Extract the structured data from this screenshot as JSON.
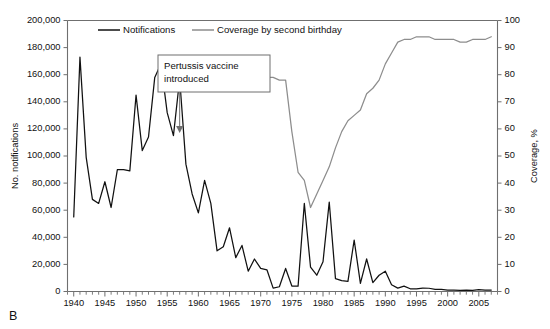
{
  "panel_label": "B",
  "legend": {
    "position": "top-inside",
    "entries": [
      {
        "label": "Notifications",
        "color": "#111111"
      },
      {
        "label": "Coverage by second birthday",
        "color": "#8d8d8d"
      }
    ]
  },
  "annotation": {
    "line1": "Pertussis vaccine",
    "line2": "introduced",
    "points_to_year": 1957
  },
  "chart_data": {
    "type": "line",
    "title": "",
    "subtitle": "",
    "xlabel": "",
    "ylabel": "No. notifications",
    "y2label": "Coverage, %",
    "xlim": [
      1939,
      2008
    ],
    "ylim": [
      0,
      200000
    ],
    "y2lim": [
      0,
      100
    ],
    "grid": false,
    "legend_position": "top-inside",
    "yticks": [
      0,
      20000,
      40000,
      60000,
      80000,
      100000,
      120000,
      140000,
      160000,
      180000,
      200000
    ],
    "ytick_labels": [
      "0",
      "20,000",
      "40,000",
      "60,000",
      "80,000",
      "100,000",
      "120,000",
      "140,000",
      "160,000",
      "180,000",
      "200,000"
    ],
    "y2ticks": [
      0,
      10,
      20,
      30,
      40,
      50,
      60,
      70,
      80,
      90,
      100
    ],
    "y2tick_labels": [
      "0",
      "10",
      "20",
      "30",
      "40",
      "50",
      "60",
      "70",
      "80",
      "90",
      "100"
    ],
    "xticks": [
      1940,
      1945,
      1950,
      1955,
      1960,
      1965,
      1970,
      1975,
      1980,
      1985,
      1990,
      1995,
      2000,
      2005
    ],
    "xtick_labels": [
      "1940",
      "1945",
      "1950",
      "1955",
      "1960",
      "1965",
      "1970",
      "1975",
      "1980",
      "1985",
      "1990",
      "1995",
      "2000",
      "2005"
    ],
    "xminor_step": 1,
    "series": [
      {
        "name": "Notifications",
        "axis": "left",
        "color": "#111111",
        "x": [
          1940,
          1941,
          1942,
          1943,
          1944,
          1945,
          1946,
          1947,
          1948,
          1949,
          1950,
          1951,
          1952,
          1953,
          1954,
          1955,
          1956,
          1957,
          1958,
          1959,
          1960,
          1961,
          1962,
          1963,
          1964,
          1965,
          1966,
          1967,
          1968,
          1969,
          1970,
          1971,
          1972,
          1973,
          1974,
          1975,
          1976,
          1977,
          1978,
          1979,
          1980,
          1981,
          1982,
          1983,
          1984,
          1985,
          1986,
          1987,
          1988,
          1989,
          1990,
          1991,
          1992,
          1993,
          1994,
          1995,
          1996,
          1997,
          1998,
          1999,
          2000,
          2001,
          2002,
          2003,
          2004,
          2005,
          2006,
          2007
        ],
        "values": [
          55000,
          173000,
          99000,
          68000,
          65000,
          81000,
          62000,
          90000,
          90000,
          89000,
          145000,
          104000,
          114000,
          158000,
          168000,
          132000,
          115000,
          157000,
          94000,
          72000,
          58000,
          82000,
          65000,
          30000,
          33000,
          47000,
          25000,
          34000,
          15000,
          24000,
          17000,
          16000,
          2500,
          3500,
          17000,
          4000,
          4000,
          65000,
          18000,
          12000,
          22000,
          66000,
          9500,
          8000,
          7500,
          38000,
          6000,
          24000,
          6500,
          12000,
          15000,
          5000,
          2500,
          4000,
          2000,
          1900,
          2500,
          2400,
          1600,
          1500,
          1100,
          1000,
          900,
          1000,
          900,
          1300,
          1000,
          1100
        ]
      },
      {
        "name": "Coverage by second birthday",
        "axis": "right",
        "color": "#8d8d8d",
        "x": [
          1967,
          1968,
          1969,
          1970,
          1971,
          1972,
          1973,
          1974,
          1975,
          1976,
          1977,
          1978,
          1979,
          1980,
          1981,
          1982,
          1983,
          1984,
          1985,
          1986,
          1987,
          1988,
          1989,
          1990,
          1991,
          1992,
          1993,
          1994,
          1995,
          1996,
          1997,
          1998,
          1999,
          2000,
          2001,
          2002,
          2003,
          2004,
          2005,
          2006,
          2007
        ],
        "values": [
          79,
          79,
          79,
          79,
          79,
          79,
          78,
          78,
          59,
          44,
          41,
          31,
          36,
          41,
          46,
          53,
          59,
          63,
          65,
          67,
          73,
          75,
          78,
          84,
          88,
          92,
          93,
          93,
          94,
          94,
          94,
          93,
          93,
          93,
          93,
          92,
          92,
          93,
          93,
          93,
          94
        ]
      }
    ]
  }
}
